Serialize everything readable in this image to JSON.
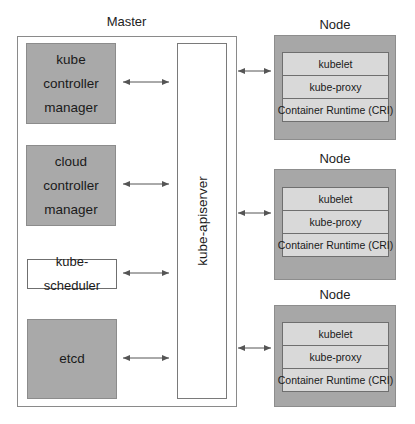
{
  "diagram": {
    "master": {
      "title": "Master",
      "components": [
        {
          "lines": [
            "kube",
            "controller",
            "manager"
          ],
          "style": "gray"
        },
        {
          "lines": [
            "cloud",
            "controller",
            "manager"
          ],
          "style": "gray"
        },
        {
          "lines": [
            "kube-scheduler"
          ],
          "style": "white"
        },
        {
          "lines": [
            "etcd"
          ],
          "style": "gray"
        }
      ],
      "apiserver": {
        "label": "kube-apiserver"
      }
    },
    "nodes": [
      {
        "title": "Node",
        "rows": [
          "kubelet",
          "kube-proxy",
          "Container Runtime (CRI)"
        ]
      },
      {
        "title": "Node",
        "rows": [
          "kubelet",
          "kube-proxy",
          "Container Runtime (CRI)"
        ]
      },
      {
        "title": "Node",
        "rows": [
          "kubelet",
          "kube-proxy",
          "Container Runtime (CRI)"
        ]
      }
    ],
    "connections": [
      {
        "from": "kube controller manager",
        "to": "kube-apiserver",
        "type": "bidirectional"
      },
      {
        "from": "cloud controller manager",
        "to": "kube-apiserver",
        "type": "bidirectional"
      },
      {
        "from": "kube-scheduler",
        "to": "kube-apiserver",
        "type": "bidirectional"
      },
      {
        "from": "etcd",
        "to": "kube-apiserver",
        "type": "bidirectional"
      },
      {
        "from": "kube-apiserver",
        "to": "Node 1",
        "type": "bidirectional"
      },
      {
        "from": "kube-apiserver",
        "to": "Node 2",
        "type": "bidirectional"
      },
      {
        "from": "kube-apiserver",
        "to": "Node 3",
        "type": "bidirectional"
      }
    ],
    "colors": {
      "component_fill": "#a9a9a9",
      "node_fill": "#a7a7a7",
      "node_row_fill": "#d9d9d9",
      "border": "#7a7a7a",
      "arrow": "#555555"
    }
  }
}
